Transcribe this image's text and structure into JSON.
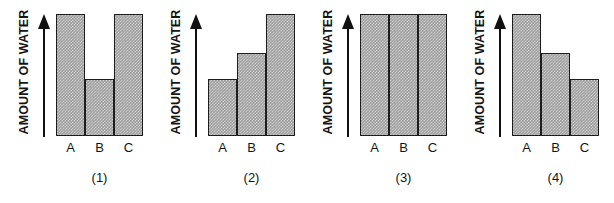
{
  "figure": {
    "panel_count": 4,
    "axis_title": "AMOUNT OF WATER",
    "categories": [
      "A",
      "B",
      "C"
    ],
    "bar_fill_color": "#a3a3a3",
    "bar_border_color": "#1d1d1d",
    "background_color": "#ffffff"
  },
  "panels": [
    {
      "caption": "(1)",
      "axis_title": "AMOUNT OF WATER",
      "cat_a": "A",
      "cat_b": "B",
      "cat_c": "C",
      "values": [
        100,
        47,
        100
      ]
    },
    {
      "caption": "(2)",
      "axis_title": "AMOUNT OF WATER",
      "cat_a": "A",
      "cat_b": "B",
      "cat_c": "C",
      "values": [
        47,
        68,
        100
      ]
    },
    {
      "caption": "(3)",
      "axis_title": "AMOUNT OF WATER",
      "cat_a": "A",
      "cat_b": "B",
      "cat_c": "C",
      "values": [
        100,
        100,
        100
      ]
    },
    {
      "caption": "(4)",
      "axis_title": "AMOUNT OF WATER",
      "cat_a": "A",
      "cat_b": "B",
      "cat_c": "C",
      "values": [
        100,
        68,
        47
      ]
    }
  ],
  "chart_data": [
    {
      "type": "bar",
      "title": "(1)",
      "categories": [
        "A",
        "B",
        "C"
      ],
      "values": [
        100,
        47,
        100
      ],
      "xlabel": "",
      "ylabel": "AMOUNT OF WATER",
      "ylim": [
        0,
        100
      ],
      "grid": false,
      "legend": "none"
    },
    {
      "type": "bar",
      "title": "(2)",
      "categories": [
        "A",
        "B",
        "C"
      ],
      "values": [
        47,
        68,
        100
      ],
      "xlabel": "",
      "ylabel": "AMOUNT OF WATER",
      "ylim": [
        0,
        100
      ],
      "grid": false,
      "legend": "none"
    },
    {
      "type": "bar",
      "title": "(3)",
      "categories": [
        "A",
        "B",
        "C"
      ],
      "values": [
        100,
        100,
        100
      ],
      "xlabel": "",
      "ylabel": "AMOUNT OF WATER",
      "ylim": [
        0,
        100
      ],
      "grid": false,
      "legend": "none"
    },
    {
      "type": "bar",
      "title": "(4)",
      "categories": [
        "A",
        "B",
        "C"
      ],
      "values": [
        100,
        68,
        47
      ],
      "xlabel": "",
      "ylabel": "AMOUNT OF WATER",
      "ylim": [
        0,
        100
      ],
      "grid": false,
      "legend": "none"
    }
  ]
}
